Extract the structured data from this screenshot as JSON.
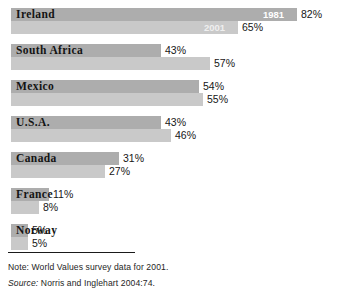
{
  "figure": {
    "title_cropped": "",
    "note_prefix": "Note:",
    "note_text": "World Values survey data for 2001.",
    "source_prefix": "Source:",
    "source_text": "Norris and Inglehart 2004:74."
  },
  "legend": {
    "series_1_year": "1981",
    "series_2_year": "2001",
    "series_1_color": "#adadad",
    "series_2_color": "#c9c9c9"
  },
  "chart_data": {
    "type": "bar",
    "orientation": "horizontal",
    "title": "",
    "xlabel": "",
    "ylabel": "",
    "xlim": [
      0,
      100
    ],
    "grid": false,
    "legend_position": "in-bar (first row only)",
    "value_suffix": "%",
    "categories": [
      "Ireland",
      "South Africa",
      "Mexico",
      "U.S.A.",
      "Canada",
      "France",
      "Norway"
    ],
    "series": [
      {
        "name": "1981",
        "color": "#adadad",
        "values": [
          82,
          43,
          54,
          43,
          31,
          11,
          5
        ],
        "labels": [
          "82%",
          "43%",
          "54%",
          "43%",
          "31%",
          "11%",
          "5%"
        ]
      },
      {
        "name": "2001",
        "color": "#c9c9c9",
        "values": [
          65,
          57,
          55,
          46,
          27,
          8,
          5
        ],
        "labels": [
          "65%",
          "57%",
          "55%",
          "46%",
          "27%",
          "8%",
          "5%"
        ]
      }
    ]
  },
  "rows": [
    {
      "country": "Ireland",
      "top": 8,
      "first": {
        "value": 82,
        "label": "82%",
        "width": 286,
        "year_tag": "1981"
      },
      "second": {
        "value": 65,
        "label": "65%",
        "width": 227,
        "year_tag": "2001"
      }
    },
    {
      "country": "South Africa",
      "top": 44,
      "first": {
        "value": 43,
        "label": "43%",
        "width": 150,
        "year_tag": ""
      },
      "second": {
        "value": 57,
        "label": "57%",
        "width": 199,
        "year_tag": ""
      }
    },
    {
      "country": "Mexico",
      "top": 80,
      "first": {
        "value": 54,
        "label": "54%",
        "width": 188,
        "year_tag": ""
      },
      "second": {
        "value": 55,
        "label": "55%",
        "width": 192,
        "year_tag": ""
      }
    },
    {
      "country": "U.S.A.",
      "top": 116,
      "first": {
        "value": 43,
        "label": "43%",
        "width": 150,
        "year_tag": ""
      },
      "second": {
        "value": 46,
        "label": "46%",
        "width": 160,
        "year_tag": ""
      }
    },
    {
      "country": "Canada",
      "top": 152,
      "first": {
        "value": 31,
        "label": "31%",
        "width": 108,
        "year_tag": ""
      },
      "second": {
        "value": 27,
        "label": "27%",
        "width": 94,
        "year_tag": ""
      }
    },
    {
      "country": "France",
      "top": 188,
      "first": {
        "value": 11,
        "label": "11%",
        "width": 38,
        "year_tag": ""
      },
      "second": {
        "value": 8,
        "label": "8%",
        "width": 28,
        "year_tag": ""
      }
    },
    {
      "country": "Norway",
      "top": 224,
      "first": {
        "value": 5,
        "label": "5%",
        "width": 17,
        "year_tag": ""
      },
      "second": {
        "value": 5,
        "label": "5%",
        "width": 17,
        "year_tag": ""
      }
    }
  ]
}
